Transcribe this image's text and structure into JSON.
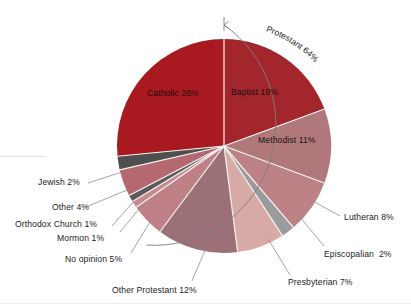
{
  "chart_data": {
    "type": "pie",
    "title": "",
    "subtitle": "",
    "xlabel": "",
    "ylabel": "",
    "legend_position": "none",
    "grid": false,
    "labels_show_percent": true,
    "start_angle_deg": 0,
    "direction": "clockwise",
    "categories": [
      "Baptist",
      "Methodist",
      "Lutheran",
      "Episcopalian",
      "Presbyterian",
      "Other Protestant",
      "No opinion",
      "Mormon",
      "Orthodox Church",
      "Other",
      "Jewish",
      "Catholic"
    ],
    "values": [
      19,
      11,
      8,
      2,
      7,
      12,
      5,
      1,
      1,
      4,
      2,
      26
    ],
    "slices": [
      {
        "name": "Baptist",
        "value": 19,
        "label": "Baptist 19%",
        "color": "#a3262c",
        "placement": "inside"
      },
      {
        "name": "Methodist",
        "value": 11,
        "label": "Methodist 11%",
        "color": "#b1787c",
        "placement": "inside"
      },
      {
        "name": "Lutheran",
        "value": 8,
        "label": "Lutheran 8%",
        "color": "#bd8286",
        "placement": "leader-right"
      },
      {
        "name": "Episcopalian",
        "value": 2,
        "label": "Episcopalian  2%",
        "color": "#9b9b9b",
        "placement": "leader-right"
      },
      {
        "name": "Presbyterian",
        "value": 7,
        "label": "Presbyterian 7%",
        "color": "#d8aaa6",
        "placement": "leader-right"
      },
      {
        "name": "Other Protestant",
        "value": 12,
        "label": "Other Protestant 12%",
        "color": "#9c7077",
        "placement": "leader-bottom"
      },
      {
        "name": "No opinion",
        "value": 5,
        "label": "No opinion 5%",
        "color": "#bf8086",
        "placement": "leader-left"
      },
      {
        "name": "Mormon",
        "value": 1,
        "label": "Mormon 1%",
        "color": "#c78b8f",
        "placement": "leader-left"
      },
      {
        "name": "Orthodox Church",
        "value": 1,
        "label": "Orthodox Church 1%",
        "color": "#5b5b5b",
        "placement": "leader-left"
      },
      {
        "name": "Other",
        "value": 4,
        "label": "Other 4%",
        "color": "#b5686f",
        "placement": "leader-left"
      },
      {
        "name": "Jewish",
        "value": 2,
        "label": "Jewish 2%",
        "color": "#4f4f4f",
        "placement": "leader-left"
      },
      {
        "name": "Catholic",
        "value": 26,
        "label": "Catholic 26%",
        "color": "#a81a20",
        "placement": "inside"
      }
    ],
    "annotations": [
      {
        "name": "protestant-bracket",
        "label": "Protestant 64%",
        "value": 64,
        "type": "arc-bracket",
        "spans": [
          "Baptist",
          "Methodist",
          "Lutheran",
          "Episcopalian",
          "Presbyterian",
          "Other Protestant"
        ],
        "text_orientation": "curved"
      }
    ]
  },
  "labels": {
    "catholic": "Catholic 26%",
    "baptist": "Baptist 19%",
    "methodist": "Methodist 11%",
    "lutheran": "Lutheran 8%",
    "episcopalian": "Episcopalian  2%",
    "presbyterian": "Presbyterian 7%",
    "other_protestant": "Other Protestant 12%",
    "no_opinion": "No opinion 5%",
    "mormon": "Mormon 1%",
    "orthodox_church": "Orthodox Church 1%",
    "other": "Other 4%",
    "jewish": "Jewish 2%",
    "protestant_bracket": "Protestant 64%"
  },
  "colors": {
    "catholic": "#a81a20",
    "baptist": "#a3262c",
    "methodist": "#b1787c",
    "lutheran": "#bd8286",
    "episcopalian": "#9b9b9b",
    "presbyterian": "#d8aaa6",
    "other_protestant": "#9c7077",
    "no_opinion": "#bf8086",
    "mormon": "#c78b8f",
    "orthodox_church": "#5b5b5b",
    "other": "#b5686f",
    "jewish": "#4f4f4f",
    "leader_line": "#8e8e8e",
    "slice_separator": "#f6f2f2",
    "bracket": "#7d7d7d"
  }
}
